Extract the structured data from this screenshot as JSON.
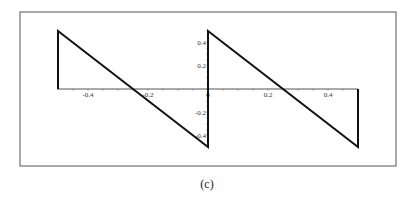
{
  "caption": "(c)",
  "chart_data": {
    "type": "line",
    "title": "",
    "xlabel": "",
    "ylabel": "",
    "xlim": [
      -0.5,
      0.5
    ],
    "ylim": [
      -0.5,
      0.5
    ],
    "grid": false,
    "legend": null,
    "x_ticks": [
      -0.4,
      -0.2,
      0,
      0.2,
      0.4
    ],
    "x_tick_labels": [
      "-0.4",
      "-0.2",
      "0",
      "0.2",
      "0.4"
    ],
    "y_ticks": [
      0.4,
      0.2,
      -0.2,
      -0.4
    ],
    "y_tick_labels": [
      "0.4",
      "0.2",
      "-0.2",
      "-0.4"
    ],
    "series": [
      {
        "name": "sawtooth",
        "x": [
          -0.5,
          -0.5,
          0,
          0,
          0.5,
          0.5
        ],
        "y": [
          0,
          0.5,
          -0.5,
          0.5,
          -0.5,
          0
        ]
      }
    ],
    "colors": {
      "line": "#111111",
      "axis": "#555555",
      "frame": "#555555"
    }
  }
}
